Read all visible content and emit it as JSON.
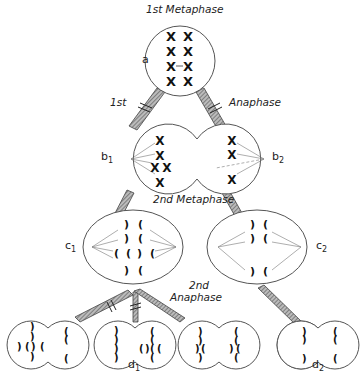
{
  "labels": {
    "first_metaphase": "1st Metaphase",
    "first": "1st",
    "anaphase": "Anaphase",
    "second_metaphase": "2nd Metaphase",
    "second": "2nd",
    "second_anaphase": "Anaphase"
  },
  "cells": {
    "a": {
      "base": "a",
      "sub": ""
    },
    "b1": {
      "base": "b",
      "sub": "1"
    },
    "b2": {
      "base": "b",
      "sub": "2"
    },
    "c1": {
      "base": "c",
      "sub": "1"
    },
    "c2": {
      "base": "c",
      "sub": "2"
    },
    "d1": {
      "base": "d",
      "sub": "1"
    },
    "d2": {
      "base": "d",
      "sub": "2"
    }
  },
  "colors": {
    "line": "#444444",
    "chromosome": "#111111",
    "band": "#888888"
  }
}
